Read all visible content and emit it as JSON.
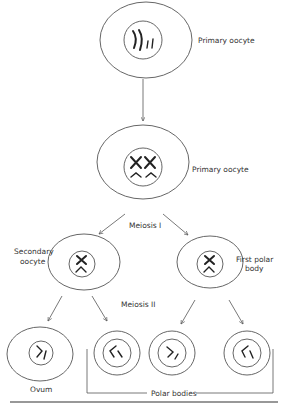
{
  "diagram": {
    "type": "oogenesis",
    "nodes": {
      "primary_oocyte_1": {
        "label": "Primary oocyte"
      },
      "primary_oocyte_2": {
        "label": "Primary oocyte"
      },
      "secondary_oocyte": {
        "label": "Secondary\noocyte",
        "label_lines": [
          "Secondary",
          "oocyte"
        ]
      },
      "first_polar_body": {
        "label": "First polar body",
        "label_lines": [
          "First polar",
          "body"
        ]
      },
      "ovum": {
        "label": "Ovum"
      },
      "polar_bodies": {
        "label": "Polar bodies"
      }
    },
    "stages": {
      "meiosis_1": "Meiosis I",
      "meiosis_2": "Meiosis II"
    },
    "edges": [
      {
        "from": "primary_oocyte_1",
        "to": "primary_oocyte_2"
      },
      {
        "from": "primary_oocyte_2",
        "to": "secondary_oocyte",
        "stage": "Meiosis I"
      },
      {
        "from": "primary_oocyte_2",
        "to": "first_polar_body",
        "stage": "Meiosis I"
      },
      {
        "from": "secondary_oocyte",
        "to": "ovum",
        "stage": "Meiosis II"
      },
      {
        "from": "secondary_oocyte",
        "to": "polar_body_a",
        "stage": "Meiosis II"
      },
      {
        "from": "first_polar_body",
        "to": "polar_body_b",
        "stage": "Meiosis II"
      },
      {
        "from": "first_polar_body",
        "to": "polar_body_c",
        "stage": "Meiosis II"
      }
    ],
    "colors": {
      "line": "#555555",
      "chromosome": "#222222",
      "text": "#333333"
    }
  }
}
